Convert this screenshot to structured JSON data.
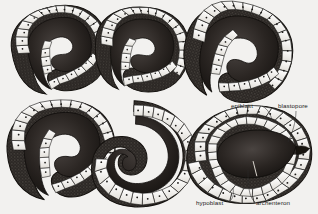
{
  "figure": {
    "background_color": "#f2f1ef",
    "ink_color": "#1a1a1a",
    "rows": 2,
    "columns": 3,
    "specimen_count": 6
  },
  "specimens": [
    {
      "id": "stage-1",
      "position": "top-left",
      "shape": "crescent",
      "rotation": -8,
      "cx": 58,
      "cy": 50,
      "scale": 1.0,
      "description": "early gastrula, shallow invagination"
    },
    {
      "id": "stage-2",
      "position": "top-center",
      "shape": "crescent",
      "rotation": 6,
      "cx": 140,
      "cy": 50,
      "scale": 0.98,
      "description": "invagination deepening"
    },
    {
      "id": "stage-3",
      "position": "top-right",
      "shape": "hook",
      "rotation": 14,
      "cx": 235,
      "cy": 52,
      "scale": 1.06,
      "description": "archenteron extending"
    },
    {
      "id": "stage-4",
      "position": "bottom-left",
      "shape": "hook",
      "rotation": -4,
      "cx": 58,
      "cy": 150,
      "scale": 1.06,
      "description": "blastopore narrowing"
    },
    {
      "id": "stage-5",
      "position": "bottom-center",
      "shape": "c-ring",
      "rotation": 2,
      "cx": 143,
      "cy": 152,
      "scale": 1.06,
      "description": "yolk plug stage, C-shaped"
    },
    {
      "id": "stage-6",
      "position": "bottom-right",
      "shape": "ovoid",
      "rotation": -6,
      "cx": 248,
      "cy": 155,
      "scale": 1.1,
      "description": "late gastrula, labelled specimen"
    }
  ],
  "labels": [
    {
      "id": "epiblast",
      "text": "epiblast",
      "text_x": 231,
      "text_y": 108,
      "anchor": "start",
      "leader": "M262,106 C268,109 272,116 272,122"
    },
    {
      "id": "blastopore",
      "text": "blastopore",
      "text_x": 278,
      "text_y": 108,
      "anchor": "start",
      "leader": "M296,111 C296,122 292,134 288,142"
    },
    {
      "id": "hypoblast",
      "text": "hypoblast",
      "text_x": 196,
      "text_y": 205,
      "anchor": "start",
      "leader": "M229,202 C233,199 234,194 233,188"
    },
    {
      "id": "archenteron",
      "text": "archenteron",
      "text_x": 256,
      "text_y": 205,
      "anchor": "start",
      "leader": "M255,202 C250,198 248,190 248,170"
    }
  ],
  "anatomy_terms": {
    "epiblast": "outer germ layer of the gastrula",
    "blastopore": "opening of the archenteron to the exterior",
    "hypoblast": "inner germ layer lining the archenteron",
    "archenteron": "primitive gut cavity formed by invagination"
  }
}
